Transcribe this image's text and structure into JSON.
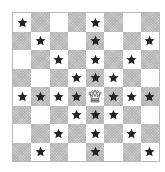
{
  "diagram": {
    "type": "chessboard",
    "size": 8,
    "light_color": "#ffffff",
    "dark_color": "#cdcdcd",
    "marker_color": "#222222",
    "piece": {
      "name": "queen",
      "row": 4,
      "col": 4,
      "glyph": "queen-icon"
    },
    "marker": "star-icon",
    "rows": [
      {
        "row": 0,
        "cells": [
          "star",
          "",
          "",
          "",
          "star",
          "",
          "",
          ""
        ]
      },
      {
        "row": 1,
        "cells": [
          "",
          "star",
          "",
          "",
          "star",
          "",
          "",
          "star"
        ]
      },
      {
        "row": 2,
        "cells": [
          "",
          "",
          "star",
          "",
          "star",
          "",
          "star",
          ""
        ]
      },
      {
        "row": 3,
        "cells": [
          "",
          "",
          "",
          "star",
          "star",
          "star",
          "",
          ""
        ]
      },
      {
        "row": 4,
        "cells": [
          "star",
          "star",
          "star",
          "star",
          "queen",
          "star",
          "star",
          "star"
        ]
      },
      {
        "row": 5,
        "cells": [
          "",
          "",
          "",
          "star",
          "star",
          "star",
          "",
          ""
        ]
      },
      {
        "row": 6,
        "cells": [
          "",
          "",
          "star",
          "",
          "star",
          "",
          "star",
          ""
        ]
      },
      {
        "row": 7,
        "cells": [
          "",
          "star",
          "",
          "",
          "star",
          "",
          "",
          "star"
        ]
      }
    ]
  }
}
